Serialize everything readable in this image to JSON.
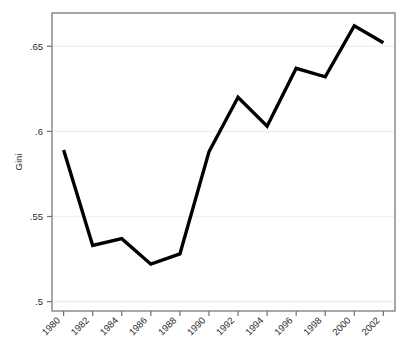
{
  "chart_data": {
    "type": "line",
    "title": "",
    "subtitle": "",
    "xlabel": "",
    "ylabel": "Gini",
    "x": [
      1980,
      1982,
      1984,
      1986,
      1988,
      1990,
      1992,
      1994,
      1996,
      1998,
      2000,
      2002
    ],
    "categories": [
      "1980",
      "1982",
      "1984",
      "1986",
      "1988",
      "1990",
      "1992",
      "1994",
      "1996",
      "1998",
      "2000",
      "2002"
    ],
    "values": [
      0.589,
      0.533,
      0.537,
      0.522,
      0.528,
      0.588,
      0.62,
      0.603,
      0.637,
      0.632,
      0.662,
      0.652
    ],
    "series": [
      {
        "name": "Gini",
        "values": [
          0.589,
          0.533,
          0.537,
          0.522,
          0.528,
          0.588,
          0.62,
          0.603,
          0.637,
          0.632,
          0.662,
          0.652
        ],
        "color": "#000000"
      }
    ],
    "xlim": [
      1979.2,
      2002.8
    ],
    "ylim": [
      0.4945,
      0.6695
    ],
    "yticks": [
      0.5,
      0.55,
      0.6,
      0.65
    ],
    "ytick_labels": [
      ".5",
      ".55",
      ".6",
      ".65"
    ],
    "xticks": [
      1980,
      1982,
      1984,
      1986,
      1988,
      1990,
      1992,
      1994,
      1996,
      1998,
      2000,
      2002
    ],
    "xtick_labels": [
      "1980",
      "1982",
      "1984",
      "1986",
      "1988",
      "1990",
      "1992",
      "1994",
      "1996",
      "1998",
      "2000",
      "2002"
    ],
    "xtick_label_rotation_deg": 45,
    "grid": {
      "horizontal": true,
      "vertical": false,
      "color": "#f0f0f0"
    },
    "legend": {
      "visible": false,
      "position": "none",
      "entries": []
    },
    "line_width_px": 3.4,
    "plot_frame_color": "#6e6e6e",
    "background_color": "#ffffff"
  },
  "figure": {
    "width_px": 409,
    "height_px": 357
  }
}
